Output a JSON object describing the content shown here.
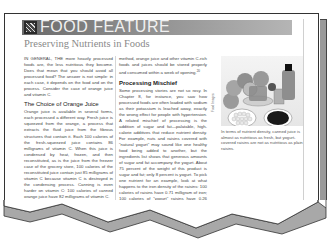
{
  "feature": {
    "banner_title": "FOOD FEATURE",
    "subtitle": "Preserving Nutrients in Foods",
    "logo_icon": "food-feature-logo-icon"
  },
  "left_column": {
    "intro_lead": "IN GENERAL, THE",
    "intro_rest": " more heavily processed foods are, the less nutritious they become. Does that mean that you should avoid all processed food? The answer is not simple: in each case, it depends on the food and on the process. Consider the case of orange juice and vitamin C.",
    "heading": "The Choice of Orange Juice",
    "para1": "Orange juice is available in several forms, each processed a different way. Fresh juice is squeezed from the orange, a process that extracts the fluid juice from the fibrous structures that contain it. Each 100 calories of the fresh-squeezed juice contains 86 milligrams of vitamin C. When this juice is condensed by heat, frozen, and then reconstituted, as is the juice from the freezer case of the grocery store, 100 calories of the reconstituted juice contain just 85 milligrams of vitamin C because vitamin C is destroyed in the condensing process. Canning is even harder on vitamin C: 100 calories of canned orange juice have 82 milligrams of vitamin C.",
    "para2": "These figures seem to indicate that"
  },
  "middle_column": {
    "para0": "method, orange juice and other vitamin C-rich foods and juices should be stored properly and consumed within a week of opening.",
    "para0_ref": "20",
    "heading": "Processing Mischief",
    "para1": "Some processing stories are not so rosy. In Chapter 8, for instance, you saw how processed foods are often loaded with sodium as their potassium is leached away, exactly the wrong effect for people with hypertension. A related mischief of processing is the addition of sugar and fat—palatable, high-calorie additives that reduce nutrient density. For example, nuts and raisins covered with \"natural yogurt\" may sound like one healthy food being added to another, but the ingredients list shows that generous amounts of sugar and fat accompany the yogurt. About 75 percent of the weight of this product is sugar and fat; only 8 percent is yogurt. To pick one nutrient for an example, look at what happens to the iron density of the raisins: 100 calories of raisins have 0.71 milligram of iron; 100 calories of \"yogurt\" raisins have 0.26 milligram of iron. These"
  },
  "figure": {
    "credit": "Food Images",
    "caption": "In terms of nutrient density, canned juice is almost as nutritious as fresh, but yogurt-covered raisins are not as nutritious as plain raisins.",
    "alt": "Photo of oranges, a glass and bottle of orange juice, a bowl of yogurt-covered raisins and a bowl of plain raisins"
  }
}
